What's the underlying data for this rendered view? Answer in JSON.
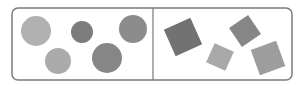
{
  "diagram": {
    "frame": {
      "x": 12,
      "y": 8,
      "width": 280,
      "height": 72,
      "radius": 6,
      "stroke": "#7a7a7a",
      "divider_x": 153
    },
    "left_panel": {
      "label": "circles",
      "shapes": [
        {
          "type": "circle",
          "cx": 36,
          "cy": 31,
          "r": 15,
          "fill": "#b1b1b1"
        },
        {
          "type": "circle",
          "cx": 82,
          "cy": 32,
          "r": 11,
          "fill": "#7c7c7c"
        },
        {
          "type": "circle",
          "cx": 133,
          "cy": 29,
          "r": 14,
          "fill": "#8c8c8c"
        },
        {
          "type": "circle",
          "cx": 58,
          "cy": 61,
          "r": 13,
          "fill": "#ababab"
        },
        {
          "type": "circle",
          "cx": 107,
          "cy": 58,
          "r": 15,
          "fill": "#868686"
        }
      ]
    },
    "right_panel": {
      "label": "squares",
      "shapes": [
        {
          "type": "square",
          "cx": 183,
          "cy": 37,
          "size": 29,
          "rotate": -24,
          "fill": "#727272"
        },
        {
          "type": "square",
          "cx": 220,
          "cy": 57,
          "size": 21,
          "rotate": 24,
          "fill": "#a9a9a9"
        },
        {
          "type": "square",
          "cx": 245,
          "cy": 31,
          "size": 23,
          "rotate": -34,
          "fill": "#868686"
        },
        {
          "type": "square",
          "cx": 268,
          "cy": 58,
          "size": 27,
          "rotate": -20,
          "fill": "#9d9d9d"
        }
      ]
    }
  }
}
